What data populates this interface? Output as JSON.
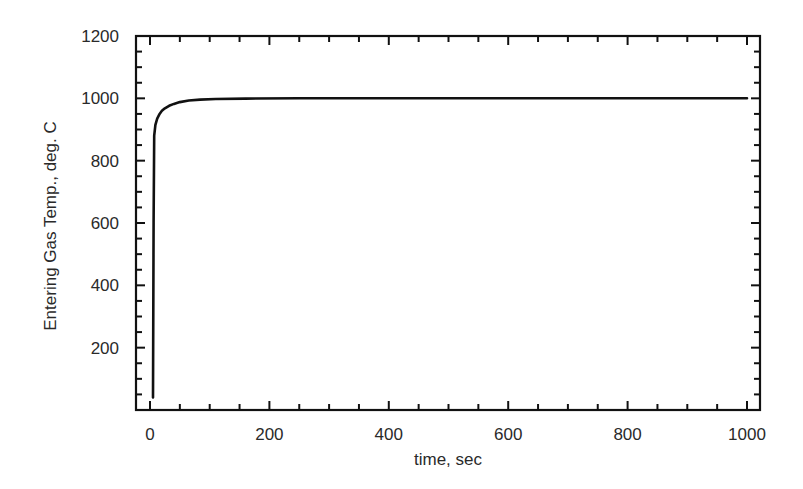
{
  "chart_data": {
    "type": "line",
    "title": "",
    "xlabel": "time, sec",
    "ylabel": "Entering Gas Temp., deg. C",
    "xlim": [
      -25,
      1020
    ],
    "ylim": [
      0,
      1200
    ],
    "x_ticks": [
      0,
      200,
      400,
      600,
      800,
      1000
    ],
    "x_tick_labels": [
      "0",
      "200",
      "400",
      "600",
      "800",
      "1000"
    ],
    "x_minor_step": 50,
    "y_ticks": [
      200,
      400,
      600,
      800,
      1000,
      1200
    ],
    "y_tick_labels": [
      "200",
      "400",
      "600",
      "800",
      "1000",
      "1200"
    ],
    "y_minor_step": 50,
    "grid": false,
    "legend": null,
    "series": [
      {
        "name": "Entering Gas Temp.",
        "color": "#111111",
        "x": [
          5,
          6,
          7,
          9,
          12,
          16,
          20,
          25,
          32,
          40,
          50,
          65,
          84,
          110,
          160,
          250,
          400,
          600,
          800,
          1000
        ],
        "y": [
          40,
          600,
          880,
          915,
          935,
          950,
          960,
          968,
          976,
          982,
          988,
          993,
          996,
          998,
          999,
          1000,
          1000,
          1000,
          1000,
          1000
        ]
      }
    ]
  }
}
